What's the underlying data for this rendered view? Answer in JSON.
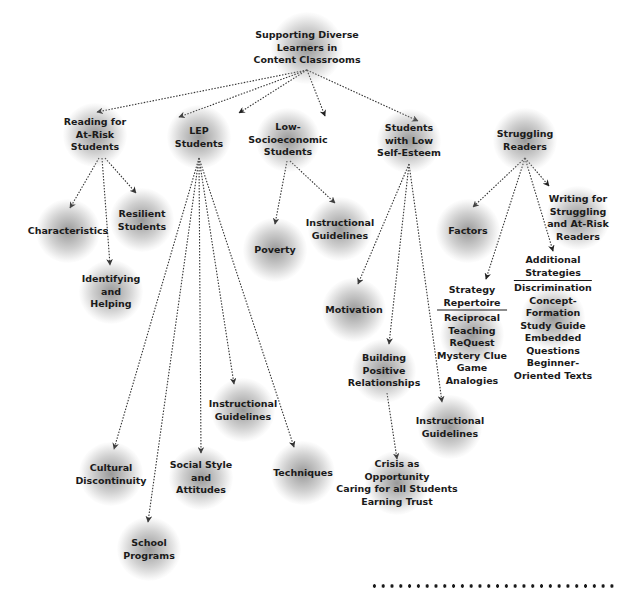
{
  "diagram": {
    "type": "concept-map",
    "root": {
      "id": "root",
      "lines": [
        "Supporting Diverse",
        "Learners in",
        "Content Classrooms"
      ],
      "x": 307,
      "y": 48
    },
    "nodes": [
      {
        "id": "reading",
        "lines": [
          "Reading for",
          "At-Risk",
          "Students"
        ],
        "x": 95,
        "y": 135,
        "parent": "root"
      },
      {
        "id": "lep",
        "lines": [
          "LEP",
          "Students"
        ],
        "x": 199,
        "y": 137,
        "parent": "root"
      },
      {
        "id": "lowses",
        "lines": [
          "Low-",
          "Socioeconomic",
          "Students"
        ],
        "x": 288,
        "y": 140,
        "parent": "root"
      },
      {
        "id": "selfesteem",
        "lines": [
          "Students",
          "with Low",
          "Self-Esteem"
        ],
        "x": 409,
        "y": 141,
        "parent": "root"
      },
      {
        "id": "struggling",
        "lines": [
          "Struggling",
          "Readers"
        ],
        "x": 525,
        "y": 140,
        "parent": "root"
      },
      {
        "id": "characteristics",
        "lines": [
          "Characteristics"
        ],
        "x": 68,
        "y": 231,
        "parent": "reading"
      },
      {
        "id": "resilient",
        "lines": [
          "Resilient",
          "Students"
        ],
        "x": 142,
        "y": 220,
        "parent": "reading"
      },
      {
        "id": "identifying",
        "lines": [
          "Identifying",
          "and",
          "Helping"
        ],
        "x": 111,
        "y": 292,
        "parent": "reading"
      },
      {
        "id": "poverty",
        "lines": [
          "Poverty"
        ],
        "x": 275,
        "y": 250,
        "parent": "lowses"
      },
      {
        "id": "lowses-guidelines",
        "lines": [
          "Instructional",
          "Guidelines"
        ],
        "x": 340,
        "y": 229,
        "parent": "lowses"
      },
      {
        "id": "motivation",
        "lines": [
          "Motivation"
        ],
        "x": 354,
        "y": 310,
        "parent": "selfesteem"
      },
      {
        "id": "building",
        "lines": [
          "Building",
          "Positive",
          "Relationships"
        ],
        "x": 384,
        "y": 371,
        "parent": "selfesteem"
      },
      {
        "id": "selfesteem-guidelines",
        "lines": [
          "Instructional",
          "Guidelines"
        ],
        "x": 450,
        "y": 427,
        "parent": "selfesteem"
      },
      {
        "id": "crisis",
        "lines": [
          "Crisis as",
          "Opportunity",
          "Caring for all Students",
          "Earning Trust"
        ],
        "x": 397,
        "y": 483,
        "parent": "building"
      },
      {
        "id": "factors",
        "lines": [
          "Factors"
        ],
        "x": 468,
        "y": 231,
        "parent": "struggling"
      },
      {
        "id": "writing",
        "lines": [
          "Writing for",
          "Struggling",
          "and At-Risk",
          "Readers"
        ],
        "x": 578,
        "y": 218,
        "parent": "struggling"
      },
      {
        "id": "strategy",
        "heading": [
          "Strategy",
          "Repertoire"
        ],
        "lines": [
          "Reciprocal",
          "Teaching",
          "ReQuest",
          "Mystery Clue",
          "Game",
          "Analogies"
        ],
        "x": 472,
        "y": 335,
        "parent": "struggling"
      },
      {
        "id": "additional",
        "heading": [
          "Additional",
          "Strategies"
        ],
        "lines": [
          "Discrimination",
          "Concept-",
          "Formation",
          "Study Guide",
          "Embedded",
          "Questions",
          "Beginner-",
          "Oriented Texts"
        ],
        "x": 553,
        "y": 318,
        "parent": "struggling"
      },
      {
        "id": "lep-guidelines",
        "lines": [
          "Instructional",
          "Guidelines"
        ],
        "x": 243,
        "y": 410,
        "parent": "lep"
      },
      {
        "id": "cultural",
        "lines": [
          "Cultural",
          "Discontinuity"
        ],
        "x": 111,
        "y": 474,
        "parent": "lep"
      },
      {
        "id": "social",
        "lines": [
          "Social Style",
          "and",
          "Attitudes"
        ],
        "x": 201,
        "y": 478,
        "parent": "lep"
      },
      {
        "id": "techniques",
        "lines": [
          "Techniques"
        ],
        "x": 303,
        "y": 473,
        "parent": "lep"
      },
      {
        "id": "school",
        "lines": [
          "School",
          "Programs"
        ],
        "x": 149,
        "y": 549,
        "parent": "lep"
      }
    ],
    "edges": [
      {
        "from": [
          307,
          70
        ],
        "to": [
          97,
          112
        ]
      },
      {
        "from": [
          307,
          70
        ],
        "to": [
          179,
          117
        ]
      },
      {
        "from": [
          307,
          70
        ],
        "to": [
          239,
          113
        ]
      },
      {
        "from": [
          307,
          70
        ],
        "to": [
          325,
          116
        ]
      },
      {
        "from": [
          307,
          70
        ],
        "to": [
          418,
          121
        ]
      },
      {
        "from": [
          99,
          158
        ],
        "to": [
          70,
          208
        ]
      },
      {
        "from": [
          102,
          158
        ],
        "to": [
          110,
          265
        ]
      },
      {
        "from": [
          105,
          158
        ],
        "to": [
          136,
          193
        ]
      },
      {
        "from": [
          199,
          158
        ],
        "to": [
          114,
          449
        ]
      },
      {
        "from": [
          199,
          158
        ],
        "to": [
          148,
          522
        ]
      },
      {
        "from": [
          199,
          158
        ],
        "to": [
          201,
          453
        ]
      },
      {
        "from": [
          199,
          158
        ],
        "to": [
          234,
          384
        ]
      },
      {
        "from": [
          199,
          158
        ],
        "to": [
          294,
          447
        ]
      },
      {
        "from": [
          287,
          161
        ],
        "to": [
          275,
          224
        ]
      },
      {
        "from": [
          290,
          161
        ],
        "to": [
          335,
          203
        ]
      },
      {
        "from": [
          409,
          164
        ],
        "to": [
          358,
          284
        ]
      },
      {
        "from": [
          409,
          164
        ],
        "to": [
          389,
          344
        ]
      },
      {
        "from": [
          409,
          164
        ],
        "to": [
          442,
          402
        ]
      },
      {
        "from": [
          387,
          393
        ],
        "to": [
          397,
          459
        ]
      },
      {
        "from": [
          525,
          158
        ],
        "to": [
          473,
          207
        ]
      },
      {
        "from": [
          525,
          158
        ],
        "to": [
          549,
          186
        ]
      },
      {
        "from": [
          525,
          158
        ],
        "to": [
          486,
          279
        ]
      },
      {
        "from": [
          525,
          158
        ],
        "to": [
          553,
          251
        ]
      }
    ],
    "footer": {
      "style": "dotted-rule",
      "dot_count": 28
    }
  },
  "colors": {
    "text": "#1a1a1a",
    "line": "#333333",
    "blob": "#808080",
    "background": "#ffffff"
  }
}
